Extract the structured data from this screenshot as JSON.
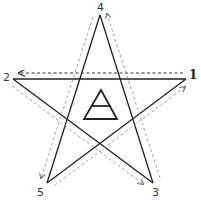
{
  "diagram": {
    "title": "",
    "type": "pentagram-invoking-sequence",
    "points": [
      {
        "id": "1",
        "label": "1",
        "x": 186,
        "y": 79
      },
      {
        "id": "2",
        "label": "2",
        "x": 13,
        "y": 79
      },
      {
        "id": "3",
        "label": "3",
        "x": 153,
        "y": 183
      },
      {
        "id": "4",
        "label": "4",
        "x": 100,
        "y": 15
      },
      {
        "id": "5",
        "label": "5",
        "x": 47,
        "y": 183
      }
    ],
    "sequence": [
      "1",
      "2",
      "3",
      "4",
      "5",
      "1"
    ],
    "center_symbol": "air-triangle-icon",
    "colors": {
      "star_line": "#222222",
      "arrow_line": "#8a8a8a",
      "arrow_line_dark": "#444444",
      "background": "#ffffff"
    }
  }
}
